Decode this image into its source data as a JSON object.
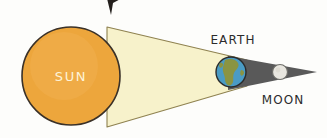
{
  "diagram": {
    "background_color": "#fdfdfb",
    "labels": {
      "sun": "SUN",
      "earth": "EARTH",
      "moon": "MOON"
    },
    "bodies": [
      {
        "name": "sun",
        "label": "SUN",
        "shape": "circle",
        "cx": 71,
        "cy": 76,
        "r": 49,
        "fill": "#eda63c",
        "stroke": "#3a3128",
        "stroke_width": 1.6,
        "label_color": "#fdf3d8",
        "label_font_size": 13
      },
      {
        "name": "earth",
        "label": "EARTH",
        "shape": "circle",
        "cx": 231,
        "cy": 72,
        "r": 15,
        "fill": "#4a9bc4",
        "stroke": "#2b2b2b",
        "stroke_width": 1.4,
        "land_fill": "#8a9442",
        "label_color": "#2b2b2b",
        "label_font_size": 12,
        "label_x": 233,
        "label_y": 44
      },
      {
        "name": "moon",
        "label": "MOON",
        "shape": "circle",
        "cx": 280,
        "cy": 72,
        "r": 7.5,
        "fill": "#e8e6df",
        "stroke": "#6f6f6a",
        "stroke_width": 1.2,
        "label_color": "#2b2b2b",
        "label_font_size": 12,
        "label_x": 283,
        "label_y": 104
      }
    ],
    "light_cone": {
      "name": "sunlight-cone",
      "fill": "#f7f2cb",
      "stroke": "#8f8250",
      "stroke_width": 1.1,
      "points": "107,27 247,60 247,86 107,127"
    },
    "shadow_cone": {
      "name": "earth-umbra-shadow",
      "fill": "#595959",
      "stroke": "none",
      "points": "228,56 317,72 228,90"
    },
    "cursor": {
      "name": "cursor-arrow",
      "fill": "#231f1c",
      "points": "104,-14 126,-4 113,3 111,15"
    },
    "colors": {
      "sun": "#eda63c",
      "light": "#f7f2cb",
      "shadow": "#595959",
      "earth_ocean": "#4a9bc4",
      "earth_land": "#8a9442",
      "moon": "#e8e6df",
      "ink": "#2b2b2b"
    }
  }
}
